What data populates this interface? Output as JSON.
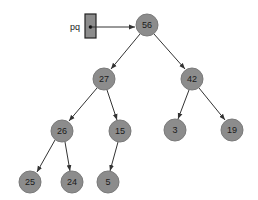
{
  "diagram": {
    "type": "binary-heap-tree",
    "pointer": {
      "label": "pq",
      "points_to": "56"
    },
    "colors": {
      "node_fill": "#8c8c8c",
      "edge": "#333333",
      "pointer_box": "#8c8c8c"
    },
    "nodes": [
      {
        "id": "n56",
        "label": "56",
        "x": 147,
        "y": 25
      },
      {
        "id": "n27",
        "label": "27",
        "x": 104,
        "y": 79
      },
      {
        "id": "n42",
        "label": "42",
        "x": 192,
        "y": 79
      },
      {
        "id": "n26",
        "label": "26",
        "x": 62,
        "y": 131
      },
      {
        "id": "n15",
        "label": "15",
        "x": 120,
        "y": 131
      },
      {
        "id": "n3",
        "label": "3",
        "x": 175,
        "y": 130
      },
      {
        "id": "n19",
        "label": "19",
        "x": 232,
        "y": 130
      },
      {
        "id": "n25",
        "label": "25",
        "x": 30,
        "y": 182
      },
      {
        "id": "n24",
        "label": "24",
        "x": 72,
        "y": 182
      },
      {
        "id": "n5",
        "label": "5",
        "x": 108,
        "y": 182
      }
    ],
    "edges": [
      {
        "from": "56",
        "to": "27"
      },
      {
        "from": "56",
        "to": "42"
      },
      {
        "from": "27",
        "to": "26"
      },
      {
        "from": "27",
        "to": "15"
      },
      {
        "from": "42",
        "to": "3"
      },
      {
        "from": "42",
        "to": "19"
      },
      {
        "from": "26",
        "to": "25"
      },
      {
        "from": "26",
        "to": "24"
      },
      {
        "from": "15",
        "to": "5"
      }
    ]
  }
}
